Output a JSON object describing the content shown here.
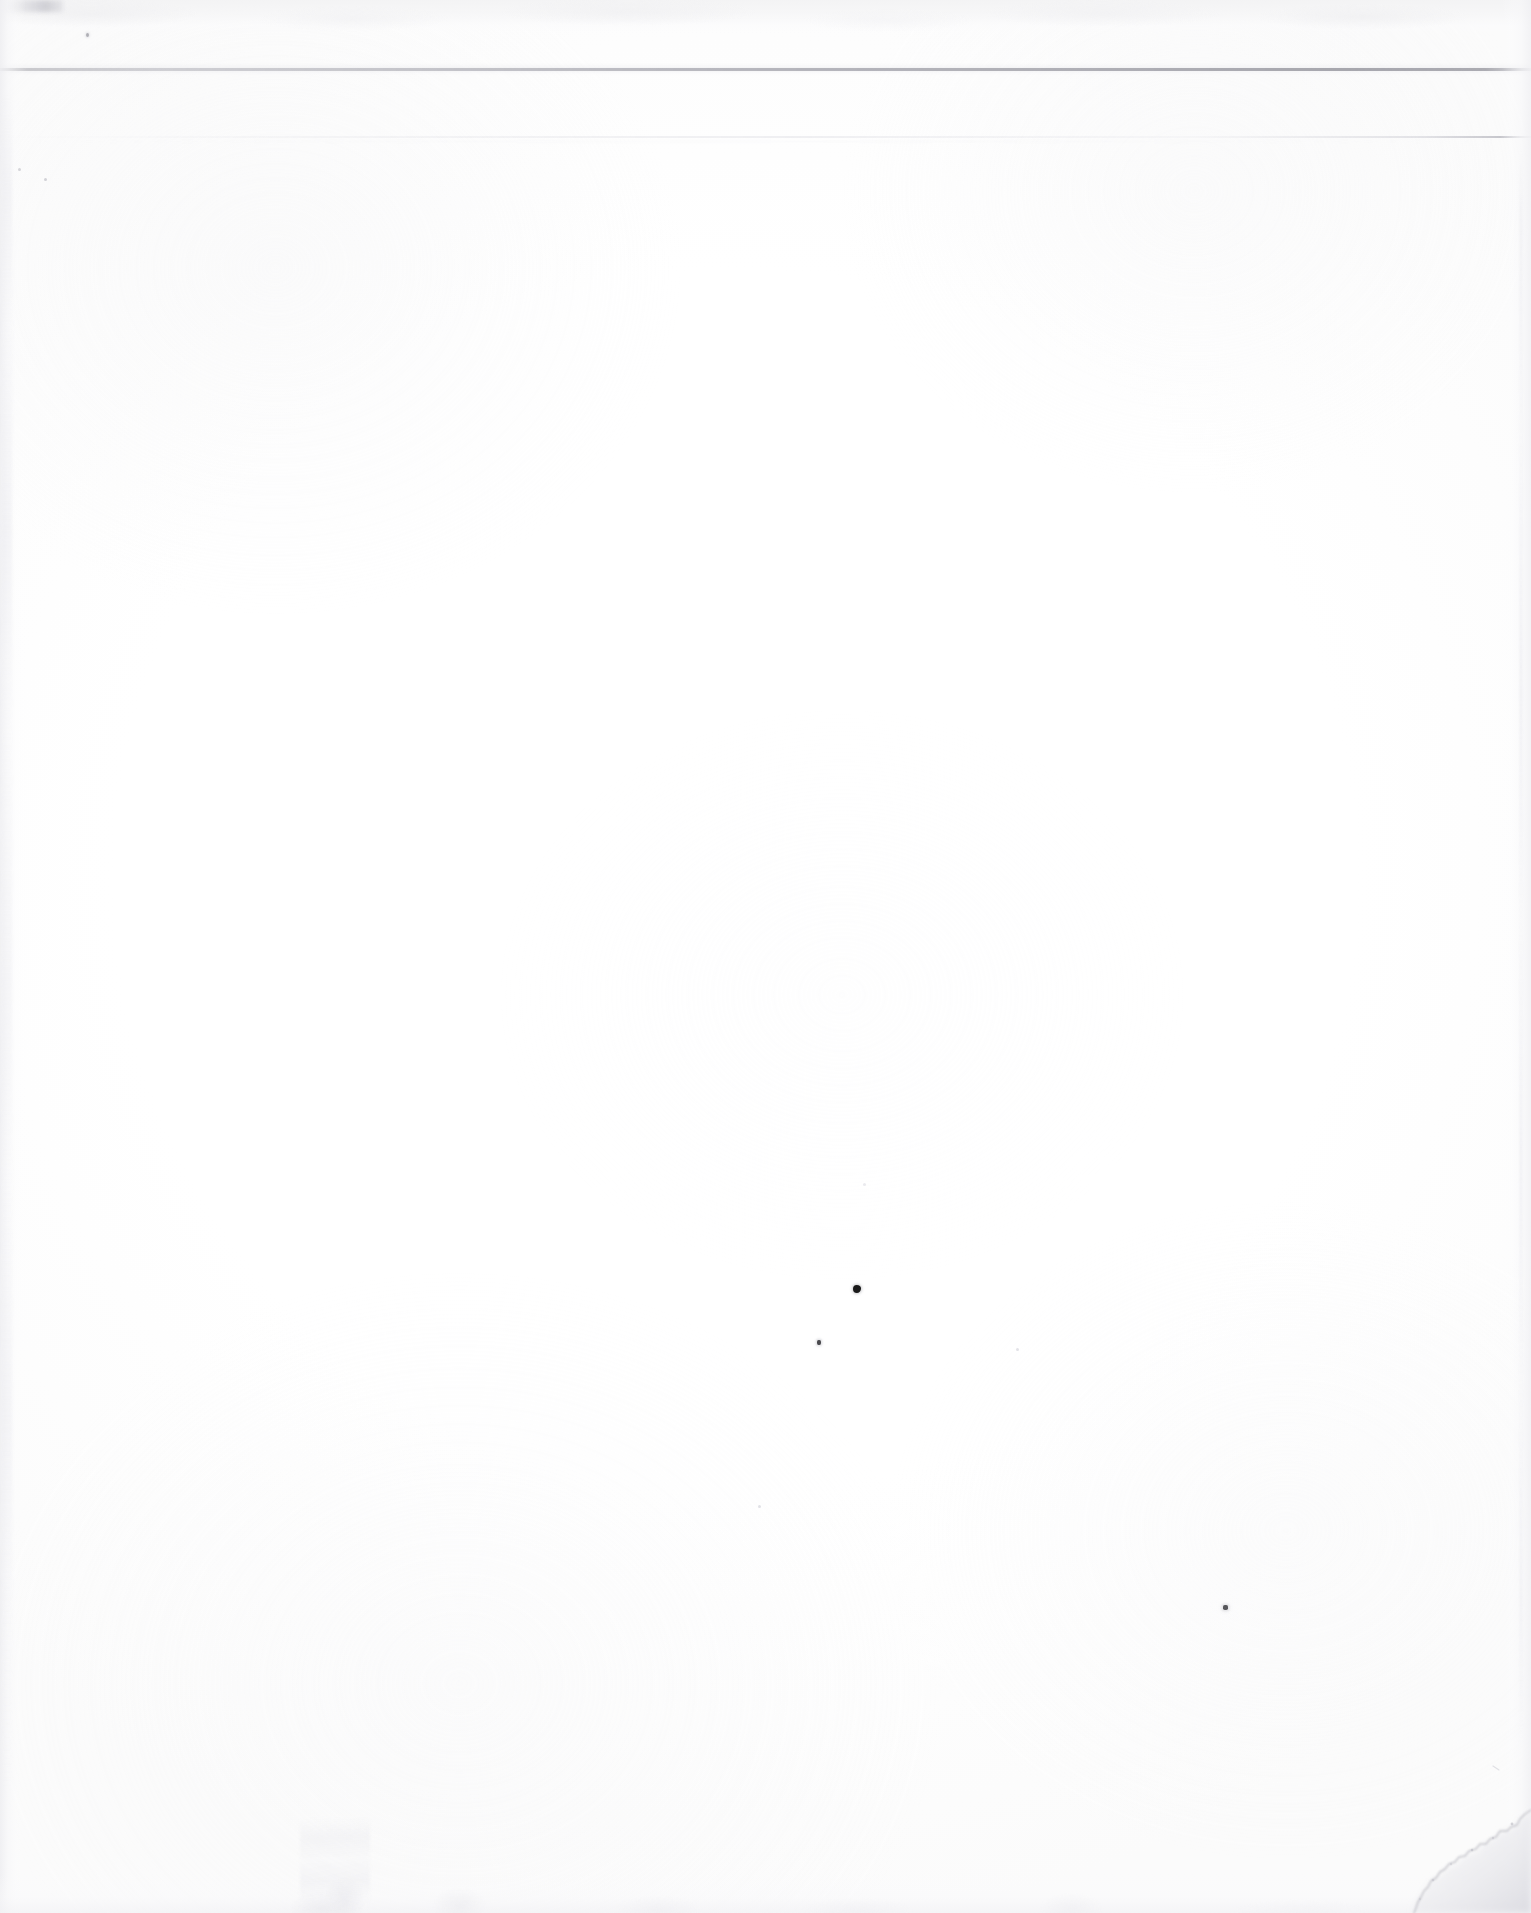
{
  "document": {
    "kind": "scanned-page",
    "title": "Scanned blank page",
    "page_text": "",
    "visible_text_lines": [],
    "background_color": "#ffffff",
    "paper_tone": "#fdfdfd"
  },
  "artifacts": {
    "top_band": {
      "name": "scanner-bed-band",
      "top": 0,
      "height": 34,
      "color": "#f3f3f4"
    },
    "scan_lines": [
      {
        "name": "primary-scan-line",
        "top": 68,
        "thickness": 3,
        "color": "#a4a4ac",
        "extent": "full-width"
      },
      {
        "name": "secondary-scan-line",
        "top": 136,
        "thickness": 2,
        "color": "#dedee4",
        "extent": "full-width-right-weighted"
      }
    ],
    "edges": [
      {
        "name": "left-edge-shadow",
        "side": "left",
        "width": 26,
        "color": "#eeeef1"
      },
      {
        "name": "right-edge-shadow",
        "side": "right",
        "width": 30,
        "color": "#f0f0f3"
      },
      {
        "name": "bottom-edge-shadow",
        "side": "bottom",
        "height": 40,
        "color": "#f2f2f5"
      }
    ],
    "torn_corner": {
      "name": "torn-bottom-right-corner",
      "corner": "bottom-right",
      "width": 190,
      "height": 155,
      "shadow_color": "#e2e2e6"
    },
    "specks": [
      {
        "name": "ink-speck-major",
        "x": 857,
        "y": 1289,
        "size": 8,
        "color": "#1a1a1a"
      },
      {
        "name": "ink-speck-minor-a",
        "x": 819,
        "y": 1343,
        "size": 5,
        "color": "#4a4a4e"
      },
      {
        "name": "ink-speck-minor-b",
        "x": 1226,
        "y": 1608,
        "size": 5,
        "color": "#57575b"
      },
      {
        "name": "ink-speck-faint-a",
        "x": 88,
        "y": 35,
        "size": 4,
        "color": "#96969e"
      }
    ],
    "fiber_smudge": {
      "name": "paper-fiber-smudge",
      "x": 300,
      "y": 1818,
      "width": 70,
      "height": 92,
      "color": "#e2e2e8"
    }
  }
}
